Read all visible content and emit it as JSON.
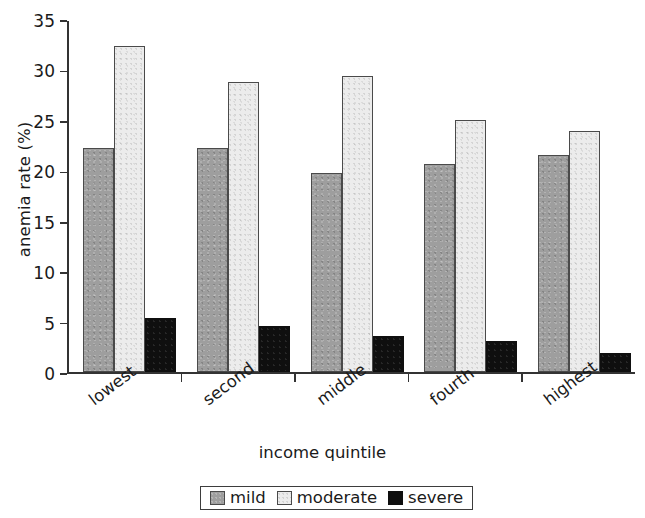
{
  "chart_data": {
    "type": "bar",
    "title": "",
    "xlabel": "income quintile",
    "ylabel": "anemia rate (%)",
    "categories": [
      "lowest",
      "second",
      "middle",
      "fourth",
      "highest"
    ],
    "series": [
      {
        "name": "mild",
        "color": "#9e9e9e",
        "values": [
          22.3,
          22.3,
          19.8,
          20.7,
          21.6
        ]
      },
      {
        "name": "moderate",
        "color": "#ececec",
        "values": [
          32.4,
          28.8,
          29.4,
          25.0,
          23.9
        ]
      },
      {
        "name": "severe",
        "color": "#0f0f0f",
        "values": [
          5.4,
          4.6,
          3.6,
          3.1,
          1.9
        ]
      }
    ],
    "ylim": [
      0,
      35
    ],
    "ytick_labels": [
      "0",
      "5",
      "10",
      "15",
      "20",
      "25",
      "30",
      "35"
    ],
    "ytick_values": [
      0,
      5,
      10,
      15,
      20,
      25,
      30,
      35
    ],
    "grid": false,
    "legend_position": "below-bottom-center",
    "legend_entries": [
      "mild",
      "moderate",
      "severe"
    ],
    "xtick_rotation_degrees": -37
  }
}
